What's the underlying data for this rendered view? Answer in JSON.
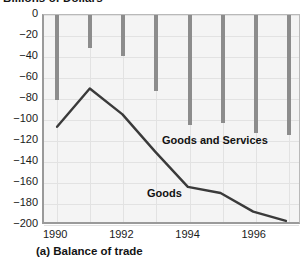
{
  "figure": {
    "title": "Billions of Dollars",
    "caption": "(a) Balance of trade"
  },
  "chart_data": {
    "type": "bar",
    "title": "Billions of Dollars",
    "subtitle": "(a) Balance of trade",
    "xlabel": "",
    "ylabel": "Billions of Dollars",
    "x": [
      1990,
      1991,
      1992,
      1993,
      1994,
      1995,
      1996,
      1997
    ],
    "categories": [
      "1990",
      "1991",
      "1992",
      "1993",
      "1994",
      "1995",
      "1996",
      "1997"
    ],
    "xlim": [
      1989.6,
      1997.4
    ],
    "ylim": [
      -200,
      0
    ],
    "ytick_labels": [
      "0",
      "−20",
      "−40",
      "−60",
      "−80",
      "−100",
      "−120",
      "−140",
      "−160",
      "−180",
      "−200"
    ],
    "ytick_values": [
      0,
      -20,
      -40,
      -60,
      -80,
      -100,
      -120,
      -140,
      -160,
      -180,
      -200
    ],
    "xtick_labels": [
      "1990",
      "1992",
      "1994",
      "1996"
    ],
    "xtick_values": [
      1990,
      1992,
      1994,
      1996
    ],
    "grid": true,
    "legend": "in-plot annotations",
    "series": [
      {
        "name": "Goods and Services",
        "type": "bar",
        "color": "#8c8c8c",
        "label_text": "Goods and Services",
        "values": [
          -81,
          -31,
          -39,
          -72,
          -105,
          -103,
          -112,
          -114
        ]
      },
      {
        "name": "Goods",
        "type": "line",
        "color": "#3a3a3a",
        "label_text": "Goods",
        "values": [
          -108,
          -71,
          -96,
          -132,
          -166,
          -172,
          -190,
          -199
        ]
      }
    ],
    "annotations": [
      {
        "text": "Goods and Services",
        "x": 1993.2,
        "y": -122
      },
      {
        "text": "Goods",
        "x": 1992.8,
        "y": -176
      }
    ]
  },
  "axis": {
    "y_ticks": [
      {
        "label": "0",
        "value": 0
      },
      {
        "label": "−20",
        "value": -20
      },
      {
        "label": "−40",
        "value": -40
      },
      {
        "label": "−60",
        "value": -60
      },
      {
        "label": "−80",
        "value": -80
      },
      {
        "label": "−100",
        "value": -100
      },
      {
        "label": "−120",
        "value": -120
      },
      {
        "label": "−140",
        "value": -140
      },
      {
        "label": "−160",
        "value": -160
      },
      {
        "label": "−180",
        "value": -180
      },
      {
        "label": "−200",
        "value": -200
      }
    ],
    "x_ticks": [
      {
        "label": "1990",
        "value": 1990
      },
      {
        "label": "1992",
        "value": 1992
      },
      {
        "label": "1994",
        "value": 1994
      },
      {
        "label": "1996",
        "value": 1996
      }
    ]
  },
  "colors": {
    "bar": "#8c8c8c",
    "line": "#3a3a3a",
    "plot_background": "#f4f4f4",
    "gridline": "#e2e2e2",
    "axis": "#9a9a9a",
    "text": "#141414"
  }
}
